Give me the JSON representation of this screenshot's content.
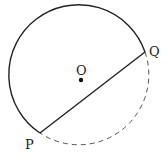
{
  "diagram": {
    "type": "geometry-circle-chord",
    "circle": {
      "center_label": "O",
      "center": [
        81,
        80
      ],
      "radius": 70
    },
    "points": [
      {
        "label": "P",
        "x": 40,
        "y": 133
      },
      {
        "label": "Q",
        "x": 145,
        "y": 52
      }
    ],
    "chord": {
      "from": "P",
      "to": "Q",
      "style": "solid"
    },
    "major_arc": {
      "style": "solid"
    },
    "minor_arc": {
      "style": "dashed"
    },
    "colors": {
      "stroke": "#222222",
      "dashed": "#555555",
      "background": "#ffffff"
    }
  }
}
